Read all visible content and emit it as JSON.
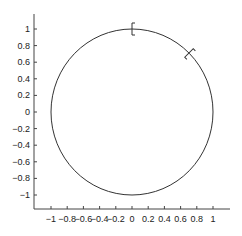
{
  "chart_data": {
    "type": "line",
    "title": "",
    "xlabel": "",
    "ylabel": "",
    "xlim": [
      -1.2,
      1.2
    ],
    "ylim": [
      -1.15,
      1.15
    ],
    "grid": false,
    "legend": null,
    "xticks": [
      "-1",
      "-0.8",
      "-0.6",
      "-0.4",
      "-0.2",
      "0",
      "0.2",
      "0.4",
      "0.6",
      "0.8",
      "1"
    ],
    "yticks": [
      "1",
      "0.8",
      "0.6",
      "0.4",
      "0.2",
      "0",
      "-0.2",
      "-0.4",
      "-0.6",
      "-0.8",
      "-1"
    ],
    "series": [
      {
        "name": "unit circle",
        "shape": "circle",
        "center": [
          0,
          0
        ],
        "radius": 1,
        "color": "#333333"
      }
    ],
    "annotations": [
      {
        "type": "bracket-marker",
        "angle_deg": 90,
        "x": 0.0,
        "y": 1.0
      },
      {
        "type": "bracket-marker",
        "angle_deg": 45,
        "x": 0.707,
        "y": 0.707
      }
    ]
  },
  "axis": {
    "x_tick_labels": [
      "−1",
      "−0.8",
      "−0.6",
      "−0.4",
      "−0.2",
      "0",
      "0.2",
      "0.4",
      "0.6",
      "0.8",
      "1"
    ],
    "y_tick_labels": [
      "1",
      "0.8",
      "0.6",
      "0.4",
      "0.2",
      "0",
      "−0.2",
      "−0.4",
      "−0.6",
      "−0.8",
      "−1"
    ]
  }
}
